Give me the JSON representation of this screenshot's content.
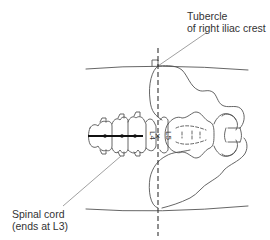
{
  "figure": {
    "type": "anatomical-diagram"
  },
  "labels": {
    "tubercle": {
      "line1": "Tubercle",
      "line2": "of right iliac crest"
    },
    "spinal_cord": {
      "line1": "Spinal cord",
      "line2": "(ends at L3)"
    },
    "vertebrae": {
      "upper": "L4",
      "lower": "L5"
    },
    "insertion_marker": "×"
  },
  "colors": {
    "line": "#555555",
    "cord": "#111111",
    "text": "#333333",
    "background": "#ffffff"
  }
}
